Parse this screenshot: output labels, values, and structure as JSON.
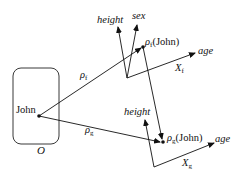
{
  "diagram": {
    "type": "vector-space mapping diagram",
    "object_space": {
      "label": "O",
      "point_label": "John"
    },
    "spaces": [
      {
        "name": "X_f",
        "label_main": "X",
        "label_sub": "f",
        "axes": [
          "height",
          "sex",
          "age"
        ],
        "mapping_label_main": "ρ",
        "mapping_label_sub": "f",
        "point_label_main": "ρ",
        "point_label_sub": "f",
        "point_label_arg": "(John)"
      },
      {
        "name": "X_g",
        "label_main": "X",
        "label_sub": "g",
        "axes": [
          "height",
          "age"
        ],
        "mapping_label_main": "ρ",
        "mapping_label_sub": "g",
        "point_label_main": "ρ",
        "point_label_sub": "g",
        "point_label_arg": "(John)"
      }
    ],
    "edges": [
      {
        "from": "John",
        "to": "ρf(John)",
        "label": "ρf"
      },
      {
        "from": "John",
        "to": "ρg(John)",
        "label": "ρg"
      },
      {
        "from": "ρf(John)",
        "to": "ρg(John)",
        "label": ""
      }
    ],
    "colors": {
      "stroke": "#111111",
      "background": "#ffffff"
    }
  }
}
